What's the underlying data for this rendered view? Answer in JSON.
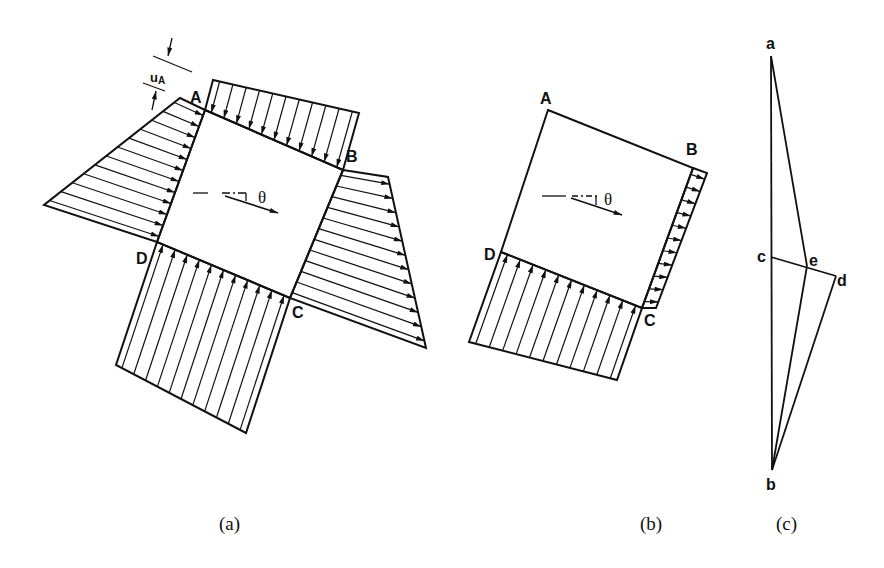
{
  "figure": {
    "panels": [
      {
        "id": "a",
        "caption": "(a)",
        "points": {
          "A": "A",
          "B": "B",
          "C": "C",
          "D": "D"
        },
        "angle_label": "θ",
        "dimension_label": "u",
        "dimension_subscript": "A"
      },
      {
        "id": "b",
        "caption": "(b)",
        "points": {
          "A": "A",
          "B": "B",
          "C": "C",
          "D": "D"
        },
        "angle_label": "θ"
      },
      {
        "id": "c",
        "caption": "(c)",
        "points": {
          "a": "a",
          "b": "b",
          "c": "c",
          "d": "d",
          "e": "e"
        }
      }
    ]
  },
  "colors": {
    "ink": "#111111",
    "background": "#ffffff"
  }
}
